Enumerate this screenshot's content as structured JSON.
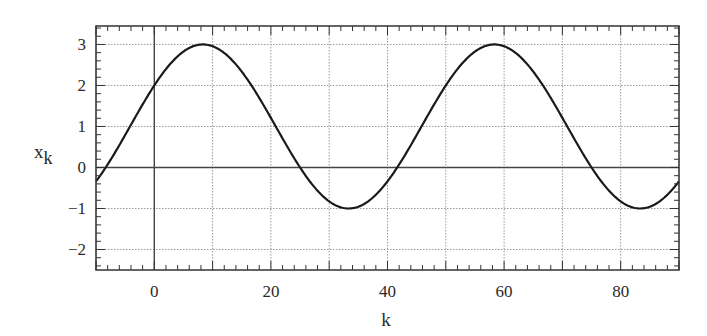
{
  "chart_data": {
    "type": "line",
    "title": "",
    "xlabel": "k",
    "ylabel": "x",
    "ylabel_subscript": "k",
    "xlim": [
      -10,
      90
    ],
    "ylim": [
      -2.5,
      3.45
    ],
    "xticks": [
      0,
      20,
      40,
      60,
      80
    ],
    "xtick_labels": [
      "0",
      "20",
      "40",
      "60",
      "80"
    ],
    "yticks": [
      -2,
      -1,
      0,
      1,
      2,
      3
    ],
    "ytick_labels": [
      "−2",
      "−1",
      "0",
      "1",
      "2",
      "3"
    ],
    "grid": true,
    "grid_style": "dotted",
    "x_grid_step": 10,
    "reference_lines": {
      "x": 0,
      "y": 0
    },
    "legend": null,
    "series": [
      {
        "name": "x_k",
        "formula": "x_k = 1 + 2 sin(2πk/50 + π/6)",
        "x": [
          -10,
          -5,
          0,
          5,
          8.3,
          10,
          15,
          20,
          25,
          30,
          33.3,
          35,
          40,
          45,
          50,
          55,
          58.3,
          60,
          65,
          70,
          75,
          80,
          83.3,
          85,
          90
        ],
        "y": [
          -0.34,
          0.79,
          2.0,
          2.83,
          3.0,
          2.96,
          2.49,
          1.42,
          0.0,
          -0.83,
          -1.0,
          -0.96,
          -0.49,
          0.58,
          2.0,
          2.83,
          3.0,
          2.96,
          2.49,
          1.42,
          0.0,
          -0.83,
          -1.0,
          -0.96,
          -0.34
        ]
      }
    ],
    "colors": {
      "line": "#1a1a1a",
      "frame": "#333333",
      "grid": "#999999"
    }
  }
}
